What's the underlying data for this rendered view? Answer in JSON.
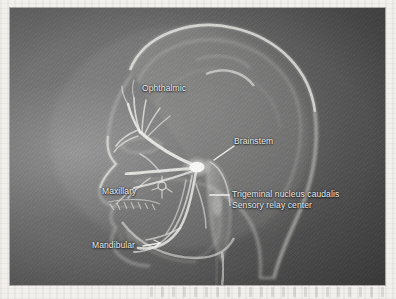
{
  "figure": {
    "kind": "anatomical-illustration",
    "medium": "scanned grayscale photograph on a light page",
    "palette": {
      "photo_background": "#585858",
      "photo_background_light": "#6e6e6e",
      "photo_background_dark": "#464646",
      "page_margin": "#f2f0ec",
      "structure_glow": "#e8e8e4",
      "nerve_white": "#f6f6f2",
      "label_text": "#f3f3f0",
      "leader_line": "#ffffff"
    }
  },
  "labels": {
    "ophthalmic": "Ophthalmic",
    "brainstem": "Brainstem",
    "trigeminal_nucleus_line1": "Trigeminal nucleus caudalis",
    "trigeminal_nucleus_line2": "Sensory relay center",
    "maxillary": "Maxillary",
    "mandibular": "Mandibular"
  },
  "structures": [
    {
      "name": "cranium-outline",
      "description": "Translucent bright outline of the skull and scalp forming the head silhouette"
    },
    {
      "name": "brain-outline",
      "description": "Faint curved outline of the cerebrum inside the cranium"
    },
    {
      "name": "facial-profile",
      "description": "Profile of forehead, nose, lips and chin on the left side"
    },
    {
      "name": "mandible",
      "description": "Lower jaw bone arc with tooth row"
    },
    {
      "name": "maxilla-teeth",
      "description": "Upper tooth row with comb-like nerve innervation"
    },
    {
      "name": "trigeminal-ganglion",
      "description": "Bright node where the three nerve divisions converge"
    },
    {
      "name": "ophthalmic-division",
      "description": "Upper nerve branches fanning over the forehead and orbit"
    },
    {
      "name": "maxillary-division",
      "description": "Middle nerve branches spreading across the cheek and upper teeth"
    },
    {
      "name": "mandibular-division",
      "description": "Lower nerve branches running along the jaw to the lower teeth"
    },
    {
      "name": "brainstem-column",
      "description": "Elongated vertical structure descending behind the jaw"
    },
    {
      "name": "spinal-cord",
      "description": "Continuation of the brainstem into the neck"
    },
    {
      "name": "trigeminal-nucleus-caudalis",
      "description": "Sensory relay center within the lower brainstem"
    }
  ],
  "leader_lines": [
    {
      "name": "brainstem-leader",
      "from": [
        210,
        152
      ],
      "to": [
        233,
        138
      ],
      "style": "diagonal"
    },
    {
      "name": "trigeminal-nucleus-leader",
      "from": [
        202,
        187
      ],
      "to": [
        220,
        187
      ],
      "style": "horizontal"
    },
    {
      "name": "mandibular-leader",
      "from": [
        135,
        239
      ],
      "to": [
        152,
        236
      ],
      "style": "short-arrow"
    }
  ]
}
